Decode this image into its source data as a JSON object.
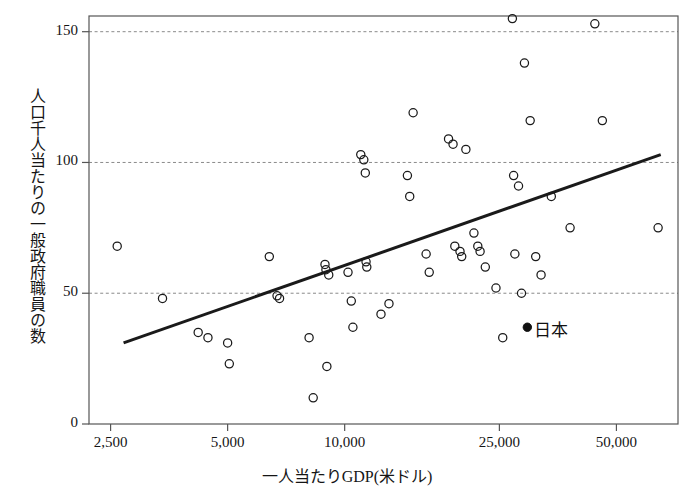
{
  "chart_data": {
    "type": "scatter",
    "title": "",
    "xlabel": "一人当たりGDP(米ドル)",
    "ylabel": "人口千人当たりの一般政府職員の数",
    "xscale": "log",
    "yscale": "linear",
    "xlim": [
      2200,
      72000
    ],
    "ylim": [
      0,
      156
    ],
    "grid": "horizontal-dashed",
    "legend": "none",
    "xticks": [
      2500,
      5000,
      10000,
      25000,
      50000
    ],
    "xtick_labels": [
      "2,500",
      "5,000",
      "10,000",
      "25,000",
      "50,000"
    ],
    "yticks": [
      0,
      50,
      100,
      150
    ],
    "ytick_labels": [
      "0",
      "50",
      "100",
      "150"
    ],
    "marker_style": "open-circle",
    "marker_color": "#1a1a1a",
    "points": [
      {
        "x": 2600,
        "y": 68
      },
      {
        "x": 3400,
        "y": 48
      },
      {
        "x": 4200,
        "y": 35
      },
      {
        "x": 4450,
        "y": 33
      },
      {
        "x": 5000,
        "y": 31
      },
      {
        "x": 5050,
        "y": 23
      },
      {
        "x": 6400,
        "y": 64
      },
      {
        "x": 6700,
        "y": 49
      },
      {
        "x": 6800,
        "y": 48
      },
      {
        "x": 8100,
        "y": 33
      },
      {
        "x": 8300,
        "y": 10
      },
      {
        "x": 8900,
        "y": 61
      },
      {
        "x": 8950,
        "y": 59
      },
      {
        "x": 9000,
        "y": 22
      },
      {
        "x": 9100,
        "y": 57
      },
      {
        "x": 10200,
        "y": 58
      },
      {
        "x": 10400,
        "y": 47
      },
      {
        "x": 10500,
        "y": 37
      },
      {
        "x": 11000,
        "y": 103
      },
      {
        "x": 11200,
        "y": 101
      },
      {
        "x": 11300,
        "y": 96
      },
      {
        "x": 11350,
        "y": 62
      },
      {
        "x": 11400,
        "y": 60
      },
      {
        "x": 12400,
        "y": 42
      },
      {
        "x": 13000,
        "y": 46
      },
      {
        "x": 14500,
        "y": 95
      },
      {
        "x": 14700,
        "y": 87
      },
      {
        "x": 15000,
        "y": 119
      },
      {
        "x": 16200,
        "y": 65
      },
      {
        "x": 16500,
        "y": 58
      },
      {
        "x": 18500,
        "y": 109
      },
      {
        "x": 19000,
        "y": 107
      },
      {
        "x": 19200,
        "y": 68
      },
      {
        "x": 19800,
        "y": 66
      },
      {
        "x": 20000,
        "y": 64
      },
      {
        "x": 20500,
        "y": 105
      },
      {
        "x": 21500,
        "y": 73
      },
      {
        "x": 22000,
        "y": 68
      },
      {
        "x": 22300,
        "y": 66
      },
      {
        "x": 23000,
        "y": 60
      },
      {
        "x": 24500,
        "y": 52
      },
      {
        "x": 25500,
        "y": 33
      },
      {
        "x": 27000,
        "y": 155
      },
      {
        "x": 27200,
        "y": 95
      },
      {
        "x": 27400,
        "y": 65
      },
      {
        "x": 28000,
        "y": 91
      },
      {
        "x": 28500,
        "y": 50
      },
      {
        "x": 29000,
        "y": 138
      },
      {
        "x": 30000,
        "y": 116
      },
      {
        "x": 31000,
        "y": 64
      },
      {
        "x": 32000,
        "y": 57
      },
      {
        "x": 34000,
        "y": 87
      },
      {
        "x": 38000,
        "y": 75
      },
      {
        "x": 44000,
        "y": 153
      },
      {
        "x": 46000,
        "y": 116
      },
      {
        "x": 64000,
        "y": 75
      }
    ],
    "highlight_point": {
      "label": "日本",
      "x": 29500,
      "y": 37,
      "marker_style": "filled-circle",
      "color": "#111111"
    },
    "trend_line": {
      "type": "linear-fit-on-log-x",
      "from": {
        "x": 2700,
        "y": 31
      },
      "to": {
        "x": 65000,
        "y": 103
      },
      "color": "#1a1a1a",
      "width": 3
    }
  },
  "colors": {
    "axis": "#555555",
    "grid": "#8a8a8a",
    "marker": "#1a1a1a",
    "trend": "#141414",
    "background": "#ffffff"
  }
}
